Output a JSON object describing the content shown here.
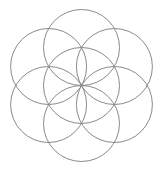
{
  "figure": {
    "name": "seed-of-life",
    "width": 160,
    "height": 172,
    "background": "#ffffff",
    "stroke_color": "#8a8a8a",
    "stroke_width": 1,
    "radius": 38,
    "circles": [
      {
        "id": "center",
        "cx": 81.5,
        "cy": 85.5
      },
      {
        "id": "top",
        "cx": 81.5,
        "cy": 47.5
      },
      {
        "id": "upper-right",
        "cx": 114.4,
        "cy": 66.5
      },
      {
        "id": "lower-right",
        "cx": 114.4,
        "cy": 104.5
      },
      {
        "id": "bottom",
        "cx": 81.5,
        "cy": 123.5
      },
      {
        "id": "lower-left",
        "cx": 48.6,
        "cy": 104.5
      },
      {
        "id": "upper-left",
        "cx": 48.6,
        "cy": 66.5
      }
    ]
  }
}
